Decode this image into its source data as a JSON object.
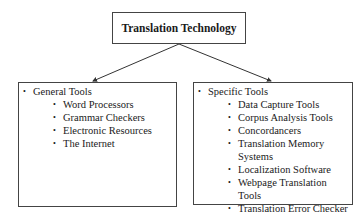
{
  "root": {
    "label": "Translation Technology"
  },
  "branches": [
    {
      "title": "General Tools",
      "items": [
        "Word Processors",
        "Grammar Checkers",
        "Electronic Resources",
        "The Internet"
      ]
    },
    {
      "title": "Specific Tools",
      "items": [
        "Data Capture Tools",
        "Corpus Analysis Tools",
        "Concordancers",
        "Translation Memory Systems",
        "Localization Software",
        "Webpage Translation Tools",
        "Translation Error Checker"
      ]
    }
  ],
  "colors": {
    "border": "#444444",
    "text": "#1a1a1a",
    "background": "#ffffff"
  }
}
